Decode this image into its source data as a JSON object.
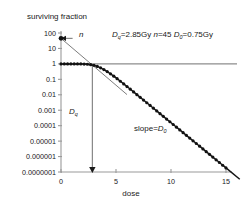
{
  "figure": {
    "name": "cell-survival-curve",
    "background": "#ffffff"
  },
  "chart_data": {
    "type": "line",
    "title": "",
    "ylabel": "surviving fraction",
    "xlabel": "dose",
    "yscale": "log",
    "ylim": [
      1e-07,
      100
    ],
    "xlim": [
      0,
      15
    ],
    "grid": false,
    "legend": null,
    "ytick_labels": [
      "100",
      "10",
      "1",
      "0.1",
      "0.01",
      "0.001",
      "0.0001",
      "0.00001",
      "0.000001",
      "0.0000001"
    ],
    "ytick_values": [
      100,
      10,
      1,
      0.1,
      0.01,
      0.001,
      0.0001,
      1e-05,
      1e-06,
      1e-07
    ],
    "xtick_labels": [
      "0",
      "5",
      "10",
      "15"
    ],
    "xtick_values": [
      0,
      5,
      10,
      15
    ],
    "model": "multi-target single-hit: SF = 1 - (1 - exp(-D/D0))^n",
    "parameters": {
      "Dq": 2.85,
      "Dq_unit": "Gy",
      "n": 45,
      "D0": 0.75,
      "D0_unit": "Gy"
    },
    "series": [
      {
        "name": "survival-data-points",
        "marker": "filled-circle",
        "color": "#121212",
        "x": [
          0.0,
          0.3,
          0.6,
          0.9,
          1.2,
          1.5,
          1.8,
          2.1,
          2.4,
          2.7,
          3.0,
          3.3,
          3.6,
          3.9,
          4.2,
          4.5,
          4.8,
          5.1,
          5.4,
          5.7,
          6.0,
          6.3,
          6.6,
          6.9,
          7.2,
          7.5,
          7.8,
          8.1,
          8.4,
          8.7,
          9.0,
          9.3,
          9.6,
          9.9,
          10.2,
          10.5,
          10.8,
          11.1,
          11.4,
          11.7,
          12.0,
          12.3,
          12.6,
          12.9,
          13.2,
          13.5,
          13.8,
          14.1,
          14.4,
          14.7,
          15.0
        ],
        "y": [
          1.0,
          1.0,
          1.0,
          0.9999,
          0.9995,
          0.998,
          0.993,
          0.979,
          0.949,
          0.892,
          0.803,
          0.686,
          0.556,
          0.429,
          0.318,
          0.228,
          0.16,
          0.11,
          0.0751,
          0.0508,
          0.0342,
          0.0229,
          0.0153,
          0.0102,
          0.00683,
          0.00456,
          0.00304,
          0.00203,
          0.00135,
          0.000903,
          0.000602,
          0.000402,
          0.000268,
          0.000179,
          0.000119,
          7.95e-05,
          5.3e-05,
          3.54e-05,
          2.36e-05,
          1.57e-05,
          1.05e-05,
          7e-06,
          4.67e-06,
          3.11e-06,
          2.08e-06,
          1.39e-06,
          9.25e-07,
          6.17e-07,
          4.11e-07,
          2.74e-07,
          1.83e-07
        ]
      },
      {
        "name": "extrapolation-line",
        "style": "thin-solid",
        "color": "#6e6e6e",
        "x": [
          0.0,
          6.0
        ],
        "y": [
          45.0,
          0.0103
        ],
        "note": "back-extrapolated terminal slope intercepting y-axis at n = 45"
      },
      {
        "name": "survival-fraction-unity-reference-line",
        "style": "horizontal-solid",
        "color": "#8d8d8d",
        "y": 1.0,
        "x": [
          0,
          16.0
        ]
      }
    ],
    "annotations": [
      {
        "name": "n-extrapolation-number-label",
        "text": "n",
        "italic": true,
        "x": 1.6,
        "y": 45,
        "arrow_to": {
          "x": 0.0,
          "y": 45
        }
      },
      {
        "name": "parameters-annotation",
        "text": "Dq = 2.85 Gy  n = 45  D0 = 0.75 Gy",
        "x": 5.2,
        "y": 45
      },
      {
        "name": "dq-quasi-threshold-label",
        "text": "Dq",
        "italic": true,
        "x": 1.0,
        "y": 0.0012
      },
      {
        "name": "slope-label",
        "text": "slope = D0",
        "italic": false,
        "x": 7.2,
        "y": 0.00013
      },
      {
        "name": "dq-measure-arrow",
        "from": {
          "x": 2.85,
          "y": 1.0
        },
        "to": {
          "x": 2.85,
          "y": 1e-07
        },
        "arrowhead": "down"
      }
    ]
  },
  "labels": {
    "y_axis_title": "surviving fraction",
    "x_axis_title": "dose",
    "n_label": "n",
    "dq_label": "D",
    "dq_sub": "q",
    "d0_label": "D",
    "d0_sub": "0",
    "slope_prefix": "slope=",
    "params_dq_name": "D",
    "params_dq_sub": "q",
    "params_dq_value": "=2.85Gy",
    "params_n_name": "n",
    "params_n_value": "=45",
    "params_d0_name": "D",
    "params_d0_sub": "0",
    "params_d0_value": "=0.75Gy"
  }
}
